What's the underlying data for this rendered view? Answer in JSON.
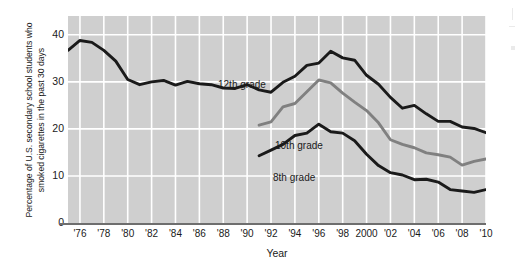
{
  "chart_data": {
    "type": "line",
    "title": "",
    "xlabel": "Year",
    "ylabel_line1": "Percentage of U.S. secondary school students who",
    "ylabel_line2": "smoked cigarettes in the past 30 days",
    "ylim": [
      0,
      44
    ],
    "xlim": [
      1975,
      2010
    ],
    "yticks": [
      0,
      10,
      20,
      30,
      40
    ],
    "ytick_labels": [
      "0",
      "10",
      "20",
      "30",
      "40"
    ],
    "xticks": [
      1976,
      1978,
      1980,
      1982,
      1984,
      1986,
      1988,
      1990,
      1992,
      1994,
      1996,
      1998,
      2000,
      2002,
      2004,
      2006,
      2008,
      2010
    ],
    "xtick_labels": [
      "'76",
      "'78",
      "'80",
      "'82",
      "'84",
      "'86",
      "'88",
      "'90",
      "'92",
      "'94",
      "'96",
      "'98",
      "2000",
      "'02",
      "'04",
      "'06",
      "'08",
      "'10"
    ],
    "grid": true,
    "grid_color": "#ffffff",
    "plot_background": "#cfcfcf",
    "legend_position": "inline-annotations",
    "series": [
      {
        "name": "12th grade",
        "color": "#1a1a1a",
        "x": [
          1975,
          1976,
          1977,
          1978,
          1979,
          1980,
          1981,
          1982,
          1983,
          1984,
          1985,
          1986,
          1987,
          1988,
          1989,
          1990,
          1991,
          1992,
          1993,
          1994,
          1995,
          1996,
          1997,
          1998,
          1999,
          2000,
          2001,
          2002,
          2003,
          2004,
          2005,
          2006,
          2007,
          2008,
          2009,
          2010
        ],
        "values": [
          36.7,
          38.8,
          38.4,
          36.7,
          34.4,
          30.5,
          29.4,
          30.0,
          30.3,
          29.3,
          30.1,
          29.6,
          29.4,
          28.7,
          28.6,
          29.4,
          28.3,
          27.8,
          29.9,
          31.2,
          33.5,
          34.0,
          36.5,
          35.1,
          34.6,
          31.4,
          29.5,
          26.7,
          24.4,
          25.0,
          23.2,
          21.6,
          21.6,
          20.4,
          20.1,
          19.2
        ]
      },
      {
        "name": "10th grade",
        "color": "#808080",
        "x": [
          1991,
          1992,
          1993,
          1994,
          1995,
          1996,
          1997,
          1998,
          1999,
          2000,
          2001,
          2002,
          2003,
          2004,
          2005,
          2006,
          2007,
          2008,
          2009,
          2010
        ],
        "values": [
          20.8,
          21.5,
          24.7,
          25.4,
          27.9,
          30.4,
          29.8,
          27.6,
          25.7,
          23.9,
          21.3,
          17.7,
          16.7,
          16.0,
          14.9,
          14.5,
          14.0,
          12.3,
          13.1,
          13.6
        ]
      },
      {
        "name": "8th grade",
        "color": "#1a1a1a",
        "x": [
          1991,
          1992,
          1993,
          1994,
          1995,
          1996,
          1997,
          1998,
          1999,
          2000,
          2001,
          2002,
          2003,
          2004,
          2005,
          2006,
          2007,
          2008,
          2009,
          2010
        ],
        "values": [
          14.3,
          15.5,
          16.7,
          18.6,
          19.1,
          21.0,
          19.4,
          19.1,
          17.5,
          14.6,
          12.2,
          10.7,
          10.2,
          9.2,
          9.3,
          8.7,
          7.1,
          6.8,
          6.5,
          7.1
        ]
      }
    ],
    "annotations": [
      {
        "text": "12th grade",
        "series": "12th grade"
      },
      {
        "text": "10th grade",
        "series": "10th grade"
      },
      {
        "text": "8th grade",
        "series": "8th grade"
      }
    ]
  }
}
